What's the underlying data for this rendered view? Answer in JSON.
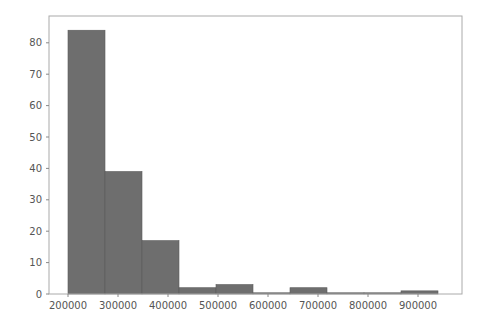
{
  "chart_data": {
    "type": "bar",
    "subtype": "histogram",
    "title": "",
    "xlabel": "",
    "ylabel": "",
    "bin_edges": [
      200000,
      274000,
      348000,
      422000,
      496000,
      570000,
      644000,
      718000,
      792000,
      866000,
      940000
    ],
    "values": [
      84,
      39,
      17,
      2,
      3,
      0,
      2,
      0,
      0,
      1
    ],
    "xlim": [
      175000,
      1000000
    ],
    "ylim": [
      0,
      88
    ],
    "x_ticks": [
      200000,
      300000,
      400000,
      500000,
      600000,
      700000,
      800000,
      900000
    ],
    "x_tick_labels": [
      "200000",
      "300000",
      "400000",
      "500000",
      "600000",
      "700000",
      "800000",
      "900000"
    ],
    "y_ticks": [
      0,
      10,
      20,
      30,
      40,
      50,
      60,
      70,
      80
    ],
    "y_tick_labels": [
      "0",
      "10",
      "20",
      "30",
      "40",
      "50",
      "60",
      "70",
      "80"
    ],
    "grid": false,
    "legend": null,
    "colors": {
      "bar_fill": "#6e6e6e",
      "bar_edge": "#5a5a5a",
      "frame": "#aaaaaa",
      "text": "#555555"
    }
  }
}
